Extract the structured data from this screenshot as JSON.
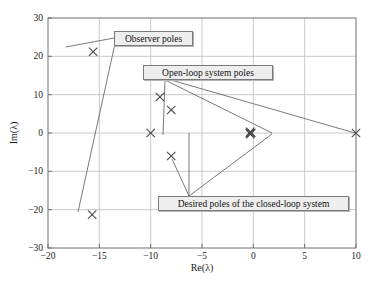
{
  "chart_data": {
    "type": "scatter",
    "title": "",
    "xlabel": "Re(λ)",
    "ylabel": "Im(λ)",
    "xlim": [
      -20,
      10
    ],
    "ylim": [
      -30,
      30
    ],
    "xticks": [
      -20,
      -15,
      -10,
      -5,
      0,
      5,
      10
    ],
    "xticklabels": [
      "−20",
      "−15",
      "−10",
      "−5",
      "0",
      "5",
      "10"
    ],
    "yticks": [
      -30,
      -20,
      -10,
      0,
      10,
      20,
      30
    ],
    "yticklabels": [
      "−30",
      "−20",
      "−10",
      "0",
      "10",
      "20",
      "30"
    ],
    "grid": true,
    "legend": "none",
    "marker": "x",
    "marker_color": "#4a4a4a",
    "series": [
      {
        "name": "Observer poles",
        "points": [
          {
            "x": -15.6,
            "y": 21.2
          },
          {
            "x": -15.7,
            "y": -21.3
          }
        ]
      },
      {
        "name": "Open-loop system poles",
        "points": [
          {
            "x": -0.35,
            "y": 0.0
          },
          {
            "x": -0.2,
            "y": 0.0
          },
          {
            "x": -0.3,
            "y": 0.3
          },
          {
            "x": -0.3,
            "y": -0.3
          },
          {
            "x": 10.0,
            "y": 0.0
          }
        ]
      },
      {
        "name": "Desired poles of the closed-loop system",
        "points": [
          {
            "x": -10.0,
            "y": 0.0
          },
          {
            "x": -8.0,
            "y": 6.0
          },
          {
            "x": -8.0,
            "y": -6.0
          },
          {
            "x": -9.1,
            "y": 9.4
          }
        ]
      }
    ],
    "annotations": [
      {
        "name": "observer-poles-callout",
        "text": "Observer poles",
        "box": {
          "x": 114,
          "y": 31,
          "w": 79,
          "h": 15
        },
        "leaders": [
          {
            "from": [
              114,
              38
            ],
            "to": [
              66,
              47
            ]
          },
          {
            "from": [
              116,
              39
            ],
            "to": [
              78,
              212
            ]
          }
        ]
      },
      {
        "name": "open-loop-poles-callout",
        "text": "Open-loop system poles",
        "box": {
          "x": 143,
          "y": 65,
          "w": 130,
          "h": 15
        },
        "leaders": [
          {
            "from": [
              165,
              80
            ],
            "to": [
              272,
              133
            ]
          },
          {
            "from": [
              171,
              80
            ],
            "to": [
              355,
              133
            ]
          },
          {
            "from": [
              165,
              80
            ],
            "to": [
              163,
              135
            ]
          }
        ]
      },
      {
        "name": "desired-poles-callout",
        "text": "Desired poles of the closed-loop system",
        "box": {
          "x": 158,
          "y": 196,
          "w": 191,
          "h": 15
        },
        "leaders": [
          {
            "from": [
              189,
              196
            ],
            "to": [
              172,
              159
            ]
          },
          {
            "from": [
              189,
              196
            ],
            "to": [
              189,
              133
            ]
          },
          {
            "from": [
              189,
              196
            ],
            "to": [
              272,
              134
            ]
          }
        ]
      }
    ]
  },
  "axes": {
    "xlabel": "Re(λ)",
    "ylabel": "Im(λ)",
    "frame_color": "#6e6e6e",
    "grid_color": "#bcbcbc"
  }
}
